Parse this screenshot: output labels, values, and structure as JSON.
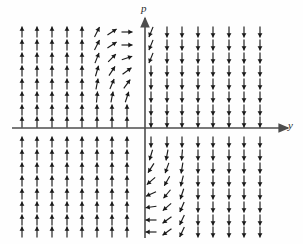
{
  "figure": {
    "kind": "direction-field",
    "title": "",
    "background_color": "#fefefe",
    "arrow_color": "#1a1a1a",
    "axis_color": "#4d4d4d"
  },
  "axes": {
    "vertical": {
      "label": "p",
      "name": "p-axis",
      "x_px": 145,
      "y_top_px": 18,
      "y_bottom_px": 238,
      "arrowhead": "up"
    },
    "horizontal": {
      "label": "y",
      "name": "y-axis",
      "x_left_px": 12,
      "x_right_px": 288,
      "y_px": 128,
      "arrowhead": "right"
    }
  },
  "chart_data": {
    "type": "scatter",
    "title": "",
    "xlabel": "y",
    "ylabel": "p",
    "grid": false,
    "legend": null,
    "xlim": [
      -8,
      8
    ],
    "ylim": [
      -8,
      8
    ],
    "grid_columns_left_px": [
      22,
      37,
      52,
      67,
      82,
      97,
      112,
      127
    ],
    "grid_columns_right_px": [
      151,
      167,
      182,
      198,
      213,
      229,
      244,
      260
    ],
    "grid_rows_upper_px": [
      32,
      45,
      58,
      71,
      84,
      97,
      110,
      122
    ],
    "grid_rows_lower_px": [
      142,
      155,
      168,
      181,
      194,
      207,
      220,
      232
    ],
    "arrow_length_px": 11,
    "rules": {
      "left_default_angle_deg": -90,
      "right_default_angle_deg": 90,
      "rotation_zone_cols_left": 3,
      "rotation_zone_cols_right": 3
    }
  }
}
